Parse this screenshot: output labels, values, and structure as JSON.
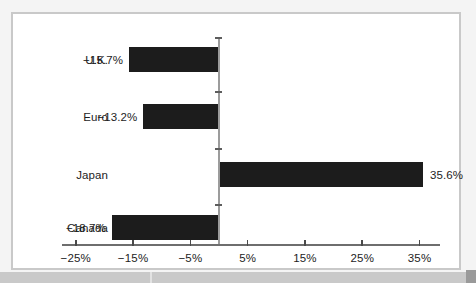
{
  "chart_data": {
    "type": "bar",
    "orientation": "horizontal",
    "title": "",
    "subtitle": "",
    "xlabel": "",
    "ylabel": "",
    "categories": [
      "U.K.",
      "Euro",
      "Japan",
      "Canada"
    ],
    "values": [
      -15.7,
      -13.2,
      35.6,
      -18.7
    ],
    "data_labels": [
      "−15.7%",
      "−13.2%",
      "35.6%",
      "−18.7%"
    ],
    "series": [
      {
        "name": "",
        "values": [
          -15.7,
          -13.2,
          35.6,
          -18.7
        ]
      }
    ],
    "xlim": [
      -30,
      40
    ],
    "xticks": [
      -25,
      -15,
      -5,
      5,
      15,
      25,
      35
    ],
    "xtick_labels": [
      "−25%",
      "−15%",
      "−5%",
      "5%",
      "15%",
      "25%",
      "35%"
    ],
    "grid": false,
    "legend": false,
    "legend_position": "none",
    "zero_line": true,
    "bar_color": "#1c1c1c",
    "axis_color": "#6e6e6e",
    "text_color": "#1d1d1d",
    "background_color": "#ffffff",
    "border_color": "#c9c9c9"
  },
  "bars": [
    {
      "category": "U.K.",
      "label": "−15.7%",
      "value": -15.7
    },
    {
      "category": "Euro",
      "label": "−13.2%",
      "value": -13.2
    },
    {
      "category": "Japan",
      "label": "35.6%",
      "value": 35.6
    },
    {
      "category": "Canada",
      "label": "−18.7%",
      "value": -18.7
    }
  ],
  "axis": {
    "ticks": [
      {
        "value": -25,
        "label": "−25%"
      },
      {
        "value": -15,
        "label": "−15%"
      },
      {
        "value": -5,
        "label": "−5%"
      },
      {
        "value": 5,
        "label": "5%"
      },
      {
        "value": 15,
        "label": "15%"
      },
      {
        "value": 25,
        "label": "25%"
      },
      {
        "value": 35,
        "label": "35%"
      }
    ]
  }
}
